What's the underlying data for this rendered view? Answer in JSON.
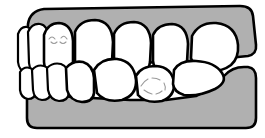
{
  "figure": {
    "title": "Lateral view of dental occlusion",
    "view": "lateral-profile",
    "background_color": "#ffffff"
  },
  "colors": {
    "gingiva_fill": "#b0b0b0",
    "tooth_fill": "#ffffff",
    "outline": "#000000",
    "occlusal_mark": "#9a9a9a",
    "background": "#ffffff"
  },
  "arches": {
    "upper": {
      "label": "Maxillary arch",
      "gingiva_label": "Upper gingiva",
      "tooth_count": 7,
      "teeth": [
        {
          "name": "upper-tooth-1",
          "label": "Incisor",
          "has_occlusal_mark": false
        },
        {
          "name": "upper-tooth-2",
          "label": "Incisor",
          "has_occlusal_mark": false
        },
        {
          "name": "upper-tooth-3",
          "label": "Canine",
          "has_occlusal_mark": true
        },
        {
          "name": "upper-tooth-4",
          "label": "First premolar",
          "has_occlusal_mark": false
        },
        {
          "name": "upper-tooth-5",
          "label": "Second premolar",
          "has_occlusal_mark": false
        },
        {
          "name": "upper-tooth-6",
          "label": "First molar",
          "has_occlusal_mark": false
        },
        {
          "name": "upper-tooth-7",
          "label": "Second molar",
          "has_occlusal_mark": false
        }
      ]
    },
    "lower": {
      "label": "Mandibular arch",
      "gingiva_label": "Lower gingiva",
      "tooth_count": 7,
      "teeth": [
        {
          "name": "lower-tooth-1",
          "label": "Incisor",
          "has_occlusal_mark": false
        },
        {
          "name": "lower-tooth-2",
          "label": "Incisor",
          "has_occlusal_mark": false
        },
        {
          "name": "lower-tooth-3",
          "label": "Incisor",
          "has_occlusal_mark": false
        },
        {
          "name": "lower-tooth-4",
          "label": "Canine",
          "has_occlusal_mark": false
        },
        {
          "name": "lower-tooth-5",
          "label": "First premolar",
          "has_occlusal_mark": false
        },
        {
          "name": "lower-tooth-6",
          "label": "Second premolar",
          "has_occlusal_mark": true
        },
        {
          "name": "lower-tooth-7",
          "label": "Molar",
          "has_occlusal_mark": false
        }
      ]
    }
  },
  "annotations": {
    "occlusal_marks": [
      {
        "name": "upper-canine-mark",
        "arch": "upper",
        "tooth_index": 3
      },
      {
        "name": "lower-premolar-mark",
        "arch": "lower",
        "tooth_index": 6
      }
    ]
  }
}
